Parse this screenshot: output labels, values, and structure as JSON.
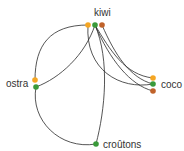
{
  "diagram": {
    "type": "chord-like network",
    "nodes": [
      {
        "id": "kiwi",
        "label": "kiwi",
        "ports": [
          "orange",
          "green",
          "brown"
        ]
      },
      {
        "id": "ostra",
        "label": "ostra",
        "ports": [
          "orange",
          "green"
        ]
      },
      {
        "id": "coco",
        "label": "coco",
        "ports": [
          "orange",
          "green",
          "brown"
        ]
      },
      {
        "id": "croutons",
        "label": "croûtons",
        "ports": [
          "green"
        ]
      }
    ],
    "edges": [
      {
        "from": "kiwi.orange",
        "to": "ostra.orange"
      },
      {
        "from": "kiwi.green",
        "to": "ostra.green"
      },
      {
        "from": "ostra.green",
        "to": "croutons.green"
      },
      {
        "from": "kiwi.green",
        "to": "croutons.green"
      },
      {
        "from": "kiwi.orange",
        "to": "coco.green"
      },
      {
        "from": "kiwi.green",
        "to": "coco.orange"
      },
      {
        "from": "kiwi.green",
        "to": "coco.brown"
      },
      {
        "from": "kiwi.brown",
        "to": "coco.green"
      }
    ],
    "colors": {
      "orange": "#f5a623",
      "green": "#3a9a3a",
      "brown": "#c0622a",
      "edge": "#2a2a2a"
    }
  }
}
